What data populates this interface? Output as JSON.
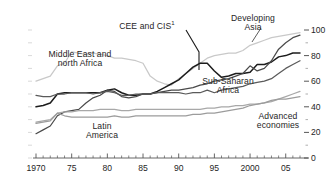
{
  "chart_data": {
    "type": "line",
    "title": "",
    "xlabel": "",
    "ylabel": "",
    "xlim": [
      1970,
      2007
    ],
    "ylim": [
      0,
      100
    ],
    "grid": false,
    "legend_position": "inline-annotations",
    "x_tick_labels": [
      "1970",
      "75",
      "80",
      "85",
      "90",
      "95",
      "2000",
      "05"
    ],
    "x_tick_values": [
      1970,
      1975,
      1980,
      1985,
      1990,
      1995,
      2000,
      2005
    ],
    "x_minor_step": 1,
    "y_tick_labels": [
      "0",
      "20",
      "40",
      "60",
      "80",
      "100"
    ],
    "y_tick_values": [
      0,
      20,
      40,
      60,
      80,
      100
    ],
    "y_minor_values": [
      10,
      30,
      50,
      70,
      90
    ],
    "y_axis_side": "right",
    "footnote_marker": "1",
    "x": [
      1970,
      1971,
      1972,
      1973,
      1974,
      1975,
      1976,
      1977,
      1978,
      1979,
      1980,
      1981,
      1982,
      1983,
      1984,
      1985,
      1986,
      1987,
      1988,
      1989,
      1990,
      1991,
      1992,
      1993,
      1994,
      1995,
      1996,
      1997,
      1998,
      1999,
      2000,
      2001,
      2002,
      2003,
      2004,
      2005,
      2006,
      2007
    ],
    "series": [
      {
        "name": "Middle East and north Africa",
        "color": "#c9c9c9",
        "label_x": 80,
        "label_y": 50,
        "values": [
          60,
          62,
          64,
          72,
          74,
          83,
          82,
          81,
          82,
          81,
          80,
          78,
          78,
          77,
          76,
          74,
          64,
          60,
          58,
          57,
          62,
          66,
          70,
          74,
          78,
          80,
          81,
          82,
          82,
          84,
          88,
          90,
          92,
          94,
          95,
          96,
          97,
          98
        ]
      },
      {
        "name": "CEE and CIS",
        "color": "#1c1c1c",
        "label_x": 147,
        "label_y": 22,
        "values": [
          40,
          41,
          43,
          50,
          51,
          51,
          51,
          51,
          51,
          51,
          53,
          54,
          51,
          49,
          49,
          50,
          50,
          52,
          55,
          58,
          61,
          66,
          71,
          74,
          74,
          68,
          63,
          64,
          66,
          66,
          67,
          73,
          73,
          75,
          79,
          80,
          82,
          82
        ]
      },
      {
        "name": "Developing Asia",
        "color": "#4a4a4a",
        "label_x": 253,
        "label_y": 14,
        "values": [
          19,
          22,
          25,
          33,
          36,
          37,
          38,
          43,
          47,
          49,
          53,
          52,
          48,
          47,
          48,
          50,
          50,
          51,
          52,
          53,
          53,
          54,
          55,
          57,
          58,
          60,
          61,
          62,
          64,
          66,
          72,
          68,
          70,
          76,
          85,
          90,
          94,
          96
        ]
      },
      {
        "name": "Sub-Saharan Africa",
        "color": "#5a5a5a",
        "label_x": 228,
        "label_y": 77,
        "values": [
          49,
          48,
          48,
          50,
          50,
          51,
          51,
          51,
          50,
          51,
          52,
          51,
          49,
          49,
          50,
          50,
          50,
          51,
          51,
          51,
          51,
          50,
          51,
          51,
          53,
          51,
          53,
          54,
          55,
          56,
          58,
          59,
          60,
          62,
          66,
          70,
          73,
          76
        ]
      },
      {
        "name": "Latin America",
        "color": "#a8a8a8",
        "label_x": 102,
        "label_y": 122,
        "values": [
          28,
          29,
          30,
          35,
          36,
          36,
          37,
          37,
          37,
          38,
          38,
          38,
          37,
          37,
          38,
          38,
          38,
          38,
          38,
          38,
          38,
          38,
          38,
          38,
          39,
          39,
          40,
          40,
          41,
          41,
          42,
          42,
          43,
          44,
          46,
          48,
          50,
          52
        ]
      },
      {
        "name": "Advanced economies",
        "color": "#9c9c9c",
        "label_x": 278,
        "label_y": 112,
        "values": [
          27,
          28,
          29,
          35,
          33,
          32,
          32,
          32,
          32,
          32,
          32,
          33,
          32,
          32,
          33,
          33,
          33,
          33,
          33,
          33,
          33,
          33,
          34,
          34,
          35,
          35,
          36,
          37,
          38,
          39,
          41,
          42,
          43,
          45,
          46,
          46,
          47,
          48
        ]
      }
    ]
  }
}
